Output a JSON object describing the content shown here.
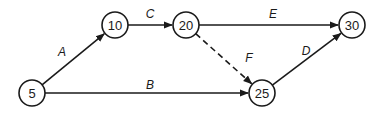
{
  "diagram": {
    "type": "activity-network",
    "nodes": [
      {
        "id": "5",
        "label": "5",
        "x": 32,
        "y": 93
      },
      {
        "id": "10",
        "label": "10",
        "x": 115,
        "y": 25
      },
      {
        "id": "20",
        "label": "20",
        "x": 186,
        "y": 25
      },
      {
        "id": "25",
        "label": "25",
        "x": 262,
        "y": 93
      },
      {
        "id": "30",
        "label": "30",
        "x": 352,
        "y": 25
      }
    ],
    "edges": [
      {
        "id": "A",
        "label": "A",
        "from": "5",
        "to": "10",
        "style": "solid",
        "lx": 62,
        "ly": 52
      },
      {
        "id": "B",
        "label": "B",
        "from": "5",
        "to": "25",
        "style": "solid",
        "lx": 150,
        "ly": 85
      },
      {
        "id": "C",
        "label": "C",
        "from": "10",
        "to": "20",
        "style": "solid",
        "lx": 150,
        "ly": 14
      },
      {
        "id": "D",
        "label": "D",
        "from": "25",
        "to": "30",
        "style": "solid",
        "lx": 306,
        "ly": 51
      },
      {
        "id": "E",
        "label": "E",
        "from": "20",
        "to": "30",
        "style": "solid",
        "lx": 273,
        "ly": 14
      },
      {
        "id": "F",
        "label": "F",
        "from": "20",
        "to": "25",
        "style": "dashed",
        "lx": 249,
        "ly": 58
      }
    ],
    "node_radius": 13,
    "stroke_color": "#1a1a1a"
  }
}
